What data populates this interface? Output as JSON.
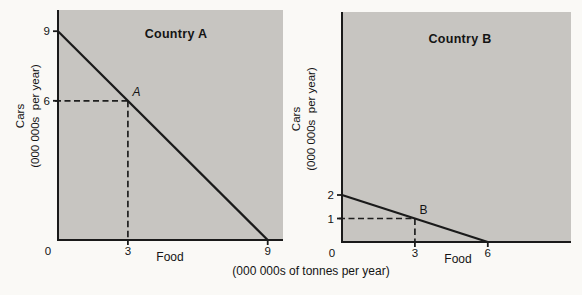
{
  "figure": {
    "units_caption": "(000 000s of tonnes per year)",
    "colors": {
      "plot_bg": "#c7c5c1",
      "line": "#1a1a1a",
      "dash": "#1f1f1f",
      "text": "#141414",
      "page_bg": "#faf9f6"
    }
  },
  "chart_data": [
    {
      "type": "line",
      "title": "Country A",
      "xlabel": "Food",
      "ylabel_line1": "Cars",
      "ylabel_line2": "(000 000s  per year)",
      "xlim": [
        0,
        9.6
      ],
      "ylim": [
        0,
        9.9
      ],
      "grid": false,
      "series": [
        {
          "name": "Country A production possibility frontier",
          "points": [
            [
              0,
              9
            ],
            [
              9,
              0
            ]
          ]
        }
      ],
      "marked_point": {
        "label": "A",
        "x": 3,
        "y": 6,
        "italic": true
      },
      "x_ticks": [
        {
          "value": 0,
          "label": "0"
        },
        {
          "value": 3,
          "label": "3"
        },
        {
          "value": 9,
          "label": "9"
        }
      ],
      "y_ticks": [
        {
          "value": 6,
          "label": "6"
        },
        {
          "value": 9,
          "label": "9"
        }
      ]
    },
    {
      "type": "line",
      "title": "Country B",
      "xlabel": "Food",
      "ylabel_line1": "Cars",
      "ylabel_line2": "(000 000s  per year)",
      "xlim": [
        0,
        9.4
      ],
      "ylim": [
        0,
        9.8
      ],
      "grid": false,
      "series": [
        {
          "name": "Country B production possibility frontier",
          "points": [
            [
              0,
              2
            ],
            [
              6,
              0
            ]
          ]
        }
      ],
      "marked_point": {
        "label": "B",
        "x": 3,
        "y": 1,
        "italic": false
      },
      "x_ticks": [
        {
          "value": 0,
          "label": "0"
        },
        {
          "value": 3,
          "label": "3"
        },
        {
          "value": 6,
          "label": "6"
        }
      ],
      "y_ticks": [
        {
          "value": 1,
          "label": "1"
        },
        {
          "value": 2,
          "label": "2"
        }
      ]
    }
  ]
}
